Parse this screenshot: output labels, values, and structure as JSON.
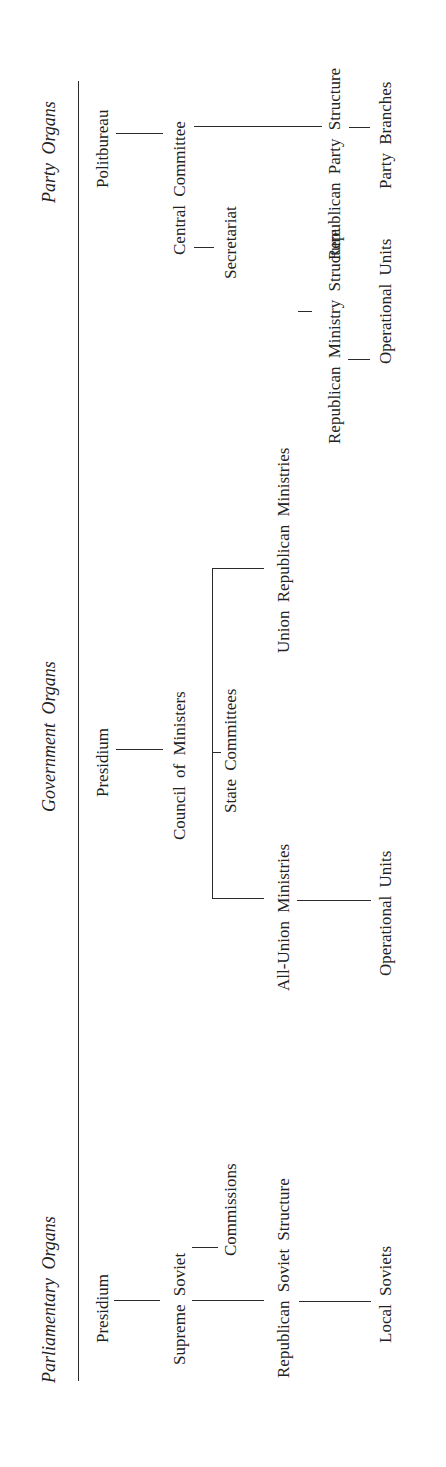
{
  "diagram": {
    "columns": [
      {
        "heading": "Parliamentary Organs",
        "nodes": {
          "presidium": "Presidium",
          "supreme_soviet": "Supreme Soviet",
          "commissions": "Commissions",
          "republican_soviet_structure": "Republican Soviet Structure",
          "local_soviets": "Local Soviets"
        }
      },
      {
        "heading": "Government Organs",
        "nodes": {
          "presidium": "Presidium",
          "council_of_ministers": "Council of Ministers",
          "state_committees": "State Committees",
          "all_union_ministries": "All-Union Ministries",
          "union_republican_ministries": "Union Republican Ministries",
          "republican_ministry_structure": "Republican Ministry Structure",
          "operational_units_all_union": "Operational Units",
          "operational_units_republican": "Operational Units"
        }
      },
      {
        "heading": "Party Organs",
        "nodes": {
          "politbureau": "Politbureau",
          "central_committee": "Central Committee",
          "secretariat": "Secretariat",
          "republican_party_structure": "Republican Party Structure",
          "party_branches": "Party Branches"
        }
      }
    ],
    "edges": [
      [
        "Presidium (Parliamentary)",
        "Supreme Soviet"
      ],
      [
        "Supreme Soviet",
        "Commissions"
      ],
      [
        "Supreme Soviet",
        "Republican Soviet Structure"
      ],
      [
        "Republican Soviet Structure",
        "Local Soviets"
      ],
      [
        "Presidium (Government)",
        "Council of Ministers"
      ],
      [
        "Council of Ministers",
        "State Committees"
      ],
      [
        "Council of Ministers",
        "All-Union Ministries"
      ],
      [
        "Council of Ministers",
        "Union Republican Ministries"
      ],
      [
        "All-Union Ministries",
        "Operational Units"
      ],
      [
        "Union Republican Ministries",
        "Republican Ministry Structure"
      ],
      [
        "Republican Ministry Structure",
        "Operational Units"
      ],
      [
        "Politbureau",
        "Central Committee"
      ],
      [
        "Central Committee",
        "Secretariat"
      ],
      [
        "Central Committee",
        "Republican Party Structure"
      ],
      [
        "Republican Party Structure",
        "Party Branches"
      ]
    ]
  }
}
